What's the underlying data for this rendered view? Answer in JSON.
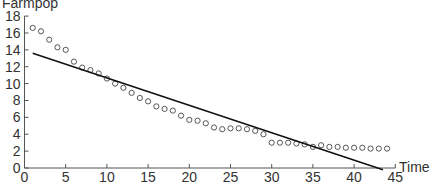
{
  "chart_data": {
    "type": "scatter",
    "title": "",
    "xlabel": "Time",
    "ylabel": "Farmpop",
    "xlim": [
      0,
      45
    ],
    "ylim": [
      0,
      18
    ],
    "xticks": [
      0,
      5,
      10,
      15,
      20,
      25,
      30,
      35,
      40,
      45
    ],
    "yticks": [
      0,
      2,
      4,
      6,
      8,
      10,
      12,
      14,
      16,
      18
    ],
    "grid": false,
    "legend": null,
    "series": [
      {
        "name": "Farmpop",
        "kind": "scatter",
        "marker": "open-circle",
        "x": [
          1,
          2,
          3,
          4,
          5,
          6,
          7,
          8,
          9,
          10,
          11,
          12,
          13,
          14,
          15,
          16,
          17,
          18,
          19,
          20,
          21,
          22,
          23,
          24,
          25,
          26,
          27,
          28,
          29,
          30,
          31,
          32,
          33,
          34,
          35,
          36,
          37,
          38,
          39,
          40,
          41,
          42,
          43,
          44
        ],
        "y": [
          16.6,
          16.2,
          15.2,
          14.3,
          14.0,
          12.6,
          11.9,
          11.6,
          11.2,
          10.6,
          10.0,
          9.5,
          8.9,
          8.3,
          7.9,
          7.3,
          7.0,
          6.8,
          6.2,
          5.7,
          5.6,
          5.3,
          4.8,
          4.6,
          4.7,
          4.7,
          4.6,
          4.4,
          4.0,
          3.0,
          3.0,
          3.0,
          2.9,
          2.8,
          2.5,
          2.7,
          2.5,
          2.5,
          2.4,
          2.4,
          2.4,
          2.3,
          2.3,
          2.3
        ]
      },
      {
        "name": "Linear fit",
        "kind": "line",
        "x": [
          1,
          43.5
        ],
        "y": [
          13.6,
          -0.2
        ]
      }
    ]
  }
}
